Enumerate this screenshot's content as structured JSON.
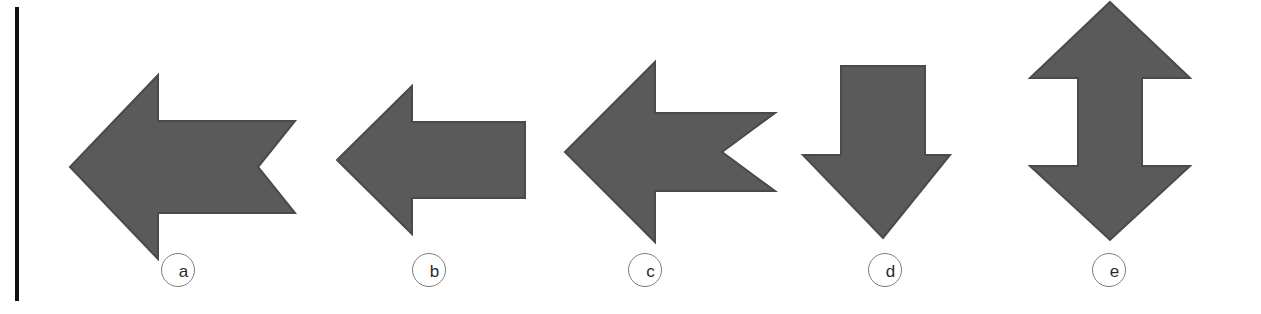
{
  "figure": {
    "panel": {
      "width": 1261,
      "height": 314,
      "background_color": "#ffffff"
    },
    "left_rule": {
      "name": "left-margin-rule",
      "color": "#111111"
    },
    "style": {
      "arrow_fill_color": "#5a5a5a",
      "arrow_stroke_color": "#4a4a4a",
      "label_ring_color": "#7d7d7d",
      "label_text_color": "#2b2b2b"
    },
    "arrows": [
      {
        "id": "a",
        "label": "a",
        "shape_name": "left-arrow-notched-tail",
        "direction": "left",
        "tail_style": "notched",
        "heads": 1,
        "points": "70,167 158,75 158,121 295,121 258,167 295,213 158,213 158,259",
        "viewbox": "0 0 320 314",
        "left": 0,
        "label_left": 161,
        "label_top": 253
      },
      {
        "id": "b",
        "label": "b",
        "shape_name": "left-arrow-flat-tail",
        "direction": "left",
        "tail_style": "flat",
        "heads": 1,
        "points": "337,160 412,86 412,122 525,122 525,198 412,198 412,234",
        "viewbox": "320 0 250 314",
        "left": 320,
        "label_left": 412,
        "label_top": 253
      },
      {
        "id": "c",
        "label": "c",
        "shape_name": "left-arrow-notched-tail-wide-head",
        "direction": "left",
        "tail_style": "notched",
        "heads": 1,
        "points": "565,152 655,62 655,113 775,113 722,152 775,191 655,191 655,242",
        "viewbox": "545 0 250 314",
        "left": 545,
        "label_left": 628,
        "label_top": 253
      },
      {
        "id": "d",
        "label": "d",
        "shape_name": "down-arrow-flat-tail",
        "direction": "down",
        "tail_style": "flat",
        "heads": 1,
        "points": "841,66 925,66 925,155 950,155 883,238 803,155 841,155",
        "viewbox": "790 0 220 314",
        "left": 790,
        "label_left": 868,
        "label_top": 253
      },
      {
        "id": "e",
        "label": "e",
        "shape_name": "double-headed-vertical-arrow",
        "direction": "up-down",
        "tail_style": "double-head",
        "heads": 2,
        "points": "1110,2 1190,78 1142,78 1142,166 1190,166 1110,240 1030,166 1078,166 1078,78 1030,78",
        "viewbox": "1010 0 251 314",
        "left": 1010,
        "label_left": 1092,
        "label_top": 253
      }
    ]
  }
}
